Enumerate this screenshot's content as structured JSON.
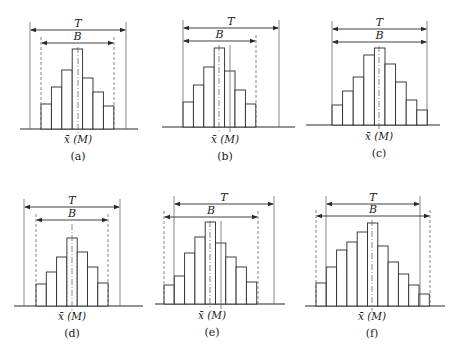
{
  "figure": {
    "labels": {
      "T": "T",
      "B": "B",
      "center": "x̄ (M)"
    }
  },
  "panels": [
    {
      "id": "a",
      "caption": "(a)",
      "origin": [
        0,
        0
      ],
      "baseline_y": 129,
      "axis_x": [
        20,
        138
      ],
      "bars_x0": 41,
      "bar_w": 10.4,
      "bar_tops": [
        104,
        87,
        70,
        49,
        78,
        92,
        106
      ],
      "T": {
        "x1": 30,
        "x2": 126,
        "y": 30,
        "solid_left": true,
        "solid_right": true
      },
      "B": {
        "x1": 41,
        "x2": 114,
        "y": 43,
        "dashed_left": true,
        "dashed_right": true
      },
      "center_lines": [
        78
      ],
      "xlabel_x": 78,
      "xlabel_y": 143,
      "caption_y": 160
    },
    {
      "id": "b",
      "caption": "(b)",
      "origin": [
        150,
        0
      ],
      "baseline_y": 127,
      "axis_x": [
        162,
        295
      ],
      "bars_x0": 183,
      "bar_w": 10.4,
      "bar_tops": [
        102,
        85,
        67,
        48,
        71,
        90,
        104
      ],
      "T": {
        "x1": 183,
        "x2": 279,
        "y": 28,
        "solid_left": true,
        "solid_right": true
      },
      "B": {
        "x1": 183,
        "x2": 256,
        "y": 41,
        "dashed_left": false,
        "dashed_right": true
      },
      "center_lines": [
        219,
        230
      ],
      "xlabel_x": 225,
      "xlabel_y": 143,
      "caption_y": 160
    },
    {
      "id": "c",
      "caption": "(c)",
      "origin": [
        300,
        0
      ],
      "baseline_y": 125,
      "axis_x": [
        306,
        440
      ],
      "bars_x0": 332,
      "bar_w": 10.6,
      "bar_tops": [
        105,
        91,
        77,
        55,
        48,
        64,
        82,
        100,
        110
      ],
      "T": {
        "x1": 332,
        "x2": 427,
        "y": 29,
        "solid_left": true,
        "solid_right": true
      },
      "B": {
        "x1": 332,
        "x2": 427,
        "y": 42,
        "solid_left": true,
        "solid_right": true
      },
      "center_lines": [
        379
      ],
      "xlabel_x": 379,
      "xlabel_y": 140,
      "caption_y": 157
    },
    {
      "id": "d",
      "caption": "(d)",
      "origin": [
        0,
        175
      ],
      "baseline_y": 306,
      "axis_x": [
        14,
        143
      ],
      "bars_x0": 36,
      "bar_w": 10.3,
      "bar_tops": [
        284,
        272,
        257,
        238,
        252,
        267,
        283
      ],
      "T": {
        "x1": 24,
        "x2": 120,
        "y": 207,
        "solid_left": true,
        "solid_right": true
      },
      "B": {
        "x1": 36,
        "x2": 108,
        "y": 220,
        "dashed_left": true,
        "dashed_right": true
      },
      "center_lines": [
        72
      ],
      "xlabel_x": 72,
      "xlabel_y": 320,
      "caption_y": 337
    },
    {
      "id": "e",
      "caption": "(e)",
      "origin": [
        150,
        175
      ],
      "baseline_y": 304,
      "axis_x": [
        155,
        285
      ],
      "bars_x0": 164,
      "bar_w": 10.3,
      "bar_tops": [
        285,
        276,
        253,
        237,
        222,
        243,
        257,
        267,
        282
      ],
      "T": {
        "x1": 174,
        "x2": 274,
        "y": 204,
        "solid_left": true,
        "solid_right": true
      },
      "B": {
        "x1": 164,
        "x2": 258,
        "y": 217,
        "dashed_left": true,
        "dashed_right": true
      },
      "center_lines": [
        210,
        221
      ],
      "xlabel_x": 212,
      "xlabel_y": 319,
      "caption_y": 336
    },
    {
      "id": "f",
      "caption": "(f)",
      "origin": [
        300,
        175
      ],
      "baseline_y": 306,
      "axis_x": [
        305,
        445
      ],
      "bars_x0": 316,
      "bar_w": 10.3,
      "bar_tops": [
        283,
        267,
        250,
        242,
        232,
        223,
        246,
        262,
        274,
        285,
        294
      ],
      "T": {
        "x1": 326,
        "x2": 420,
        "y": 204,
        "solid_left": true,
        "solid_right": true
      },
      "B": {
        "x1": 316,
        "x2": 430,
        "y": 216,
        "dashed_left": true,
        "dashed_right": true
      },
      "center_lines": [
        372
      ],
      "xlabel_x": 372,
      "xlabel_y": 320,
      "caption_y": 337
    }
  ]
}
